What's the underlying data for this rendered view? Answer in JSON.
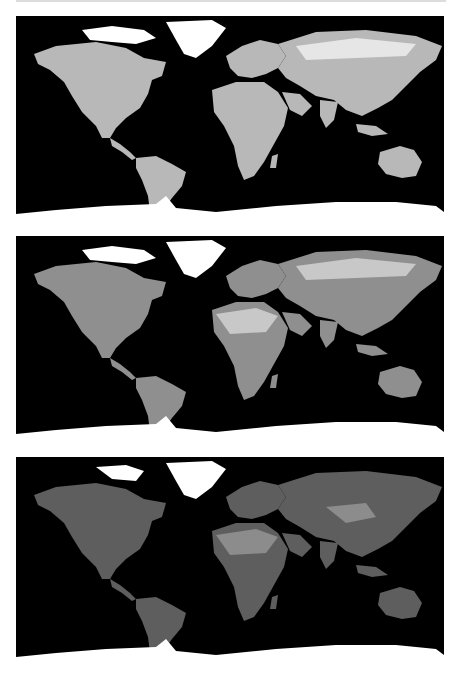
{
  "figure": {
    "header_cut_text": "",
    "panels": [
      {
        "id": "panel-1",
        "land_brightness": "bright",
        "land_fill": "#b8b8b8",
        "land_highlight": "#e6e6e6",
        "ice_fill": "#ffffff"
      },
      {
        "id": "panel-2",
        "land_brightness": "medium",
        "land_fill": "#8f8f8f",
        "land_highlight": "#c8c8c8",
        "ice_fill": "#ffffff"
      },
      {
        "id": "panel-3",
        "land_brightness": "dark",
        "land_fill": "#5e5e5e",
        "land_highlight": "#8c8c8c",
        "ice_fill": "#ffffff"
      }
    ],
    "ocean_color": "#000000",
    "page_background": "#ffffff"
  }
}
